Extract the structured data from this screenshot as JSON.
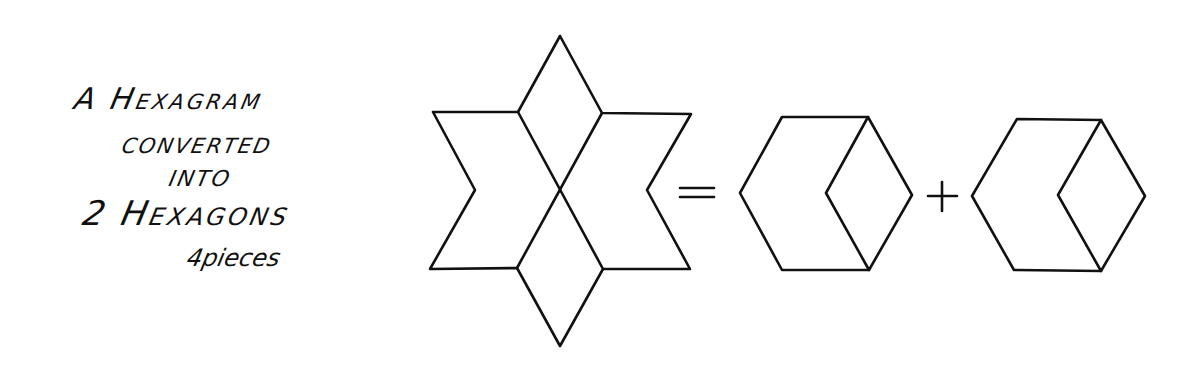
{
  "caption": {
    "line1": "A Hexagram",
    "line2": "CONVERTED",
    "line3": "INTO",
    "line4": "2 Hexagons",
    "line5": "4pieces"
  },
  "equation": {
    "equals_symbol": "=",
    "plus_symbol": "+"
  },
  "figures": {
    "hexagram": {
      "name": "hexagram",
      "description": "Six-pointed star divided by two crossing lines into 4 pieces"
    },
    "hexagon_1": {
      "name": "hexagon",
      "description": "Hexagon made of a rhombus piece and a chevron piece"
    },
    "hexagon_2": {
      "name": "hexagon",
      "description": "Hexagon made of a rhombus piece and a chevron piece"
    }
  },
  "style": {
    "ink_color": "#111111",
    "background_color": "#ffffff"
  }
}
